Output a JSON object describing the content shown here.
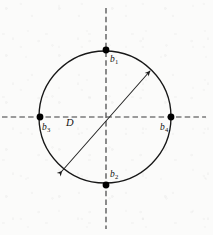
{
  "figure": {
    "kind": "geometry-diagram",
    "background_color": "#fbfbfa",
    "ink_color": "#171717",
    "axis_color": "#3a3a3a"
  },
  "circle": {
    "label": "circle-outline",
    "center_x": 105,
    "center_y": 117,
    "radius": 66,
    "stroke_color": "#171717"
  },
  "axes": {
    "vertical": {
      "name": "vertical-axis",
      "x": 106,
      "y_start": 8,
      "y_end": 229,
      "style": "dashed"
    },
    "horizontal": {
      "name": "horizontal-axis",
      "y": 117,
      "x_start": 2,
      "x_end": 206,
      "style": "dashed"
    }
  },
  "diameter": {
    "name": "diameter-D",
    "label": "D",
    "label_x": 66,
    "label_y": 118,
    "x1": 62,
    "y1": 171,
    "x2": 150,
    "y2": 71,
    "arrowheads": "both",
    "angle_degrees": 48
  },
  "points": [
    {
      "id": "b1",
      "name": "point-b1",
      "letter": "b",
      "subscript": "1",
      "position": "top",
      "cx": 106,
      "cy": 50,
      "label_x": 110,
      "label_y": 55
    },
    {
      "id": "b2",
      "name": "point-b2",
      "letter": "b",
      "subscript": "2",
      "position": "bottom",
      "cx": 106,
      "cy": 185,
      "label_x": 110,
      "label_y": 170
    },
    {
      "id": "b3",
      "name": "point-b3",
      "letter": "b",
      "subscript": "3",
      "position": "left",
      "cx": 40,
      "cy": 117,
      "label_x": 42,
      "label_y": 123
    },
    {
      "id": "b4",
      "name": "point-b4",
      "letter": "b",
      "subscript": "4",
      "position": "right",
      "cx": 171,
      "cy": 117,
      "label_x": 160,
      "label_y": 123
    }
  ]
}
